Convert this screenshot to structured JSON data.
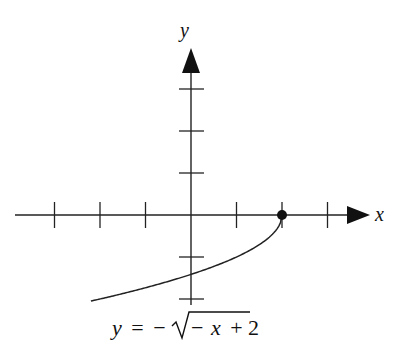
{
  "chart_data": {
    "type": "line",
    "title": "",
    "equation": "y = -√(-x + 2)",
    "equation_parts": {
      "lhs": "y",
      "eq": "=",
      "neg": "−",
      "radicand_neg": "−",
      "radicand_var": "x",
      "radicand_rest": "+ 2"
    },
    "xlabel": "x",
    "ylabel": "y",
    "xlim": [
      -4,
      4
    ],
    "ylim": [
      -2.2,
      4
    ],
    "x_ticks": [
      -3,
      -2,
      -1,
      1,
      2,
      3
    ],
    "y_ticks": [
      -2,
      -1,
      1,
      2,
      3
    ],
    "tick_labels_shown": false,
    "grid": false,
    "series": [
      {
        "name": "y = -sqrt(-x+2)",
        "x": [
          -2.2,
          -2,
          -1.5,
          -1,
          -0.5,
          0,
          0.5,
          1,
          1.5,
          1.75,
          1.9,
          2
        ],
        "y": [
          -2.05,
          -2.0,
          -1.87,
          -1.73,
          -1.58,
          -1.41,
          -1.22,
          -1.0,
          -0.71,
          -0.5,
          -0.32,
          0
        ]
      }
    ],
    "points": [
      {
        "x": 2,
        "y": 0,
        "style": "closed",
        "label": "endpoint"
      }
    ]
  }
}
